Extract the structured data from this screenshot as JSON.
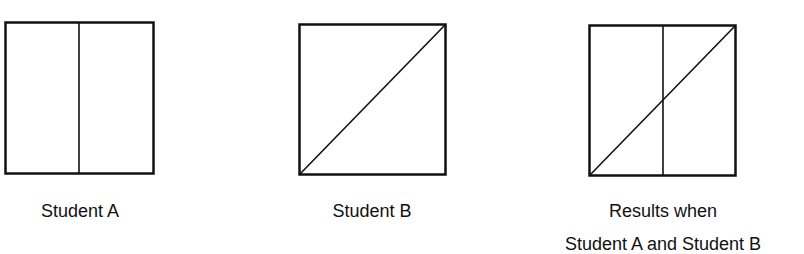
{
  "figures": [
    {
      "id": "student-a",
      "label": "Student A",
      "divisions": "vertical-line"
    },
    {
      "id": "student-b",
      "label": "Student B",
      "divisions": "diagonal-line"
    },
    {
      "id": "results",
      "label_line1": "Results when",
      "label_line2": "Student A and Student B",
      "divisions": "vertical-line-and-diagonal"
    }
  ]
}
